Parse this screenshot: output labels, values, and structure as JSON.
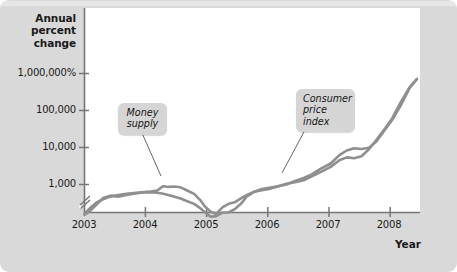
{
  "figure": {
    "background_color": "#d9d9d9",
    "plot_background_color": "#ffffff"
  },
  "axes": {
    "y_axis_title_line1": "Annual",
    "y_axis_title_line2": "percent",
    "y_axis_title_line3": "change",
    "x_axis_title": "Year"
  },
  "callouts": {
    "money_supply_line1": "Money",
    "money_supply_line2": "supply",
    "cpi_line1": "Consumer",
    "cpi_line2": "price",
    "cpi_line3": "index"
  },
  "chart_data": {
    "type": "line",
    "title": "",
    "subtitle": "",
    "xlabel": "Year",
    "ylabel": "Annual percent change",
    "yscale": "log",
    "y_axis_broken": true,
    "grid": false,
    "legend_position": "annotation-callouts",
    "ytick_labels": [
      "1,000,000%",
      "100,000",
      "10,000",
      "1,000"
    ],
    "ytick_values": [
      1000000,
      100000,
      10000,
      1000
    ],
    "xtick_labels": [
      "2003",
      "2004",
      "2005",
      "2006",
      "2007",
      "2008"
    ],
    "xtick_values": [
      2003,
      2004,
      2005,
      2006,
      2007,
      2008
    ],
    "xlim": [
      2003,
      2008.45
    ],
    "ylim": [
      90,
      4000000
    ],
    "series": [
      {
        "name": "Money supply",
        "color": "#8f8f8f",
        "x": [
          2003.0,
          2003.1,
          2003.2,
          2003.3,
          2003.42,
          2003.55,
          2003.68,
          2003.8,
          2003.92,
          2004.05,
          2004.18,
          2004.28,
          2004.36,
          2004.46,
          2004.56,
          2004.66,
          2004.78,
          2004.88,
          2004.96,
          2005.05,
          2005.14,
          2005.24,
          2005.34,
          2005.44,
          2005.54,
          2005.64,
          2005.76,
          2005.88,
          2006.0,
          2006.14,
          2006.28,
          2006.42,
          2006.56,
          2006.7,
          2006.84,
          2007.0,
          2007.14,
          2007.26,
          2007.38,
          2007.5,
          2007.62,
          2007.74,
          2007.86,
          2008.0,
          2008.14,
          2008.28,
          2008.4
        ],
        "y": [
          160,
          240,
          330,
          400,
          470,
          520,
          560,
          590,
          620,
          640,
          690,
          900,
          860,
          880,
          840,
          700,
          560,
          380,
          250,
          185,
          160,
          240,
          300,
          330,
          420,
          520,
          640,
          760,
          820,
          900,
          1000,
          1250,
          1500,
          1900,
          2700,
          3700,
          6200,
          8300,
          9500,
          9100,
          9900,
          14500,
          27000,
          56000,
          140000,
          400000,
          700000
        ]
      },
      {
        "name": "Consumer price index",
        "color": "#8f8f8f",
        "x": [
          2003.0,
          2003.1,
          2003.2,
          2003.3,
          2003.42,
          2003.55,
          2003.68,
          2003.8,
          2003.92,
          2004.05,
          2004.18,
          2004.28,
          2004.36,
          2004.46,
          2004.56,
          2004.66,
          2004.78,
          2004.88,
          2004.96,
          2005.05,
          2005.14,
          2005.24,
          2005.34,
          2005.44,
          2005.54,
          2005.64,
          2005.76,
          2005.88,
          2006.0,
          2006.14,
          2006.28,
          2006.42,
          2006.56,
          2006.7,
          2006.84,
          2007.0,
          2007.14,
          2007.26,
          2007.38,
          2007.5,
          2007.62,
          2007.74,
          2007.86,
          2008.0,
          2008.14,
          2008.28,
          2008.4
        ],
        "y": [
          150,
          200,
          290,
          430,
          500,
          470,
          520,
          560,
          600,
          620,
          600,
          560,
          520,
          470,
          420,
          360,
          300,
          230,
          175,
          135,
          140,
          175,
          175,
          215,
          300,
          480,
          640,
          700,
          760,
          880,
          1050,
          1150,
          1300,
          1700,
          2200,
          3000,
          4500,
          5400,
          5100,
          5800,
          9000,
          16000,
          29000,
          62000,
          170000,
          420000,
          720000
        ]
      }
    ]
  }
}
